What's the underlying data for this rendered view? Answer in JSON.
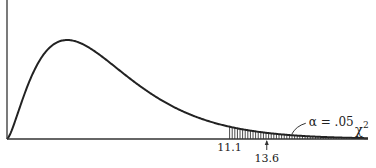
{
  "chart_data": {
    "type": "line",
    "title": "",
    "distribution": "chi-square",
    "degrees_of_freedom": 5,
    "xlabel": "χ",
    "xlabel_superscript": "2",
    "ylabel": "",
    "xlim": [
      0,
      18
    ],
    "ylim": [
      0,
      0.2165
    ],
    "grid": false,
    "critical_value": 11.1,
    "critical_value_label": "11.1",
    "observed_value": 13.6,
    "observed_value_label": "13.6",
    "alpha_label": "α = .05",
    "shaded_region": "right tail from 11.1"
  }
}
